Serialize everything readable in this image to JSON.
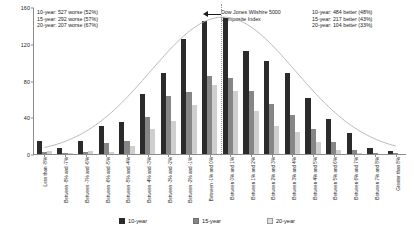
{
  "chart_data": {
    "type": "bar",
    "title": "",
    "subtitle": "",
    "xlabel": "",
    "ylabel": "",
    "ylim": [
      0,
      160
    ],
    "yticks": [
      0,
      40,
      80,
      120,
      160
    ],
    "grid": false,
    "legend_position": "bottom",
    "categories": [
      "Less than -8%",
      "Between -8% and -7%",
      "Between -7% and -6%",
      "Between -6% and -5%",
      "Between -5% and -4%",
      "Between -4% and -3%",
      "Between -3% and -2%",
      "Between -2% and -1%",
      "Between -1% and 0%",
      "Between 0% and 1%",
      "Between 1% and 2%",
      "Between 2% and 3%",
      "Between 3% and 4%",
      "Between 4% and 5%",
      "Between 5% and 6%",
      "Between 6% and 7%",
      "Between 7% and 8%",
      "Greater than 8%"
    ],
    "series": [
      {
        "name": "10-year",
        "color": "#2b2b2b",
        "values": [
          14,
          7,
          14,
          31,
          35,
          65,
          88,
          125,
          145,
          148,
          112,
          101,
          88,
          61,
          38,
          23,
          7,
          3
        ]
      },
      {
        "name": "15-year",
        "color": "#868686",
        "values": [
          2,
          1,
          2,
          12,
          14,
          40,
          63,
          67,
          85,
          83,
          69,
          54,
          42,
          27,
          13,
          4,
          1,
          1
        ]
      },
      {
        "name": "20-year",
        "color": "#cfcfcf",
        "values": [
          3,
          1,
          3,
          2,
          9,
          27,
          36,
          53,
          75,
          69,
          47,
          30,
          24,
          13,
          4,
          1,
          0,
          0
        ]
      }
    ],
    "overlay_curve": {
      "name": "normal-distribution-curve",
      "color": "#b0b0b0"
    },
    "reference_line": {
      "name": "dow-jones-wilshire-5000-marker",
      "at_category": "Between -1% and 0%",
      "style": "dotted"
    }
  },
  "annotations": {
    "left": {
      "name": "worse-than-index-stats",
      "lines": [
        "10-year: 527 worse (52%)",
        "15-year: 292 worse (57%)",
        "20-year: 207 worse (67%)"
      ]
    },
    "right": {
      "name": "better-than-index-stats",
      "lines": [
        "10-year: 484 better (48%)",
        "15-year: 217 better (43%)",
        "20-year: 104 better (33%)"
      ]
    },
    "center": {
      "name": "index-callout",
      "lines": [
        "Dow Jones Wilshire 5000",
        "Composite Index"
      ]
    }
  },
  "legend": {
    "items": [
      {
        "label": "10-year",
        "color": "#2b2b2b"
      },
      {
        "label": "15-year",
        "color": "#868686"
      },
      {
        "label": "20-year",
        "color": "#e2e2e2"
      }
    ]
  }
}
